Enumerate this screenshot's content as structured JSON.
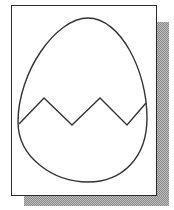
{
  "figure": {
    "frame": {
      "stroke": "#2b2b2b",
      "fill": "#ffffff"
    },
    "shadow": {
      "color": "#a0a0a0",
      "pattern": "dither"
    },
    "egg": {
      "stroke": "#333333",
      "top_y": 18,
      "bottom_y": 182,
      "left_x": 18,
      "right_x": 147
    },
    "crack": {
      "points": "19,124 44,98 72,125 100,98 127,125 146,103"
    }
  }
}
